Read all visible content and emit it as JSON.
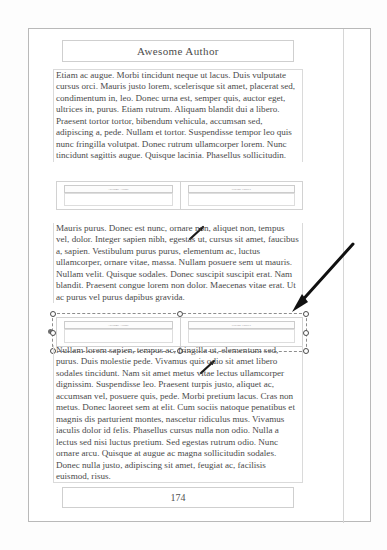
{
  "document": {
    "header": {
      "title": "Awesome Author"
    },
    "footer": {
      "page_number": "174"
    },
    "paragraphs": [
      "Etiam ac augue. Morbi tincidunt neque ut lacus. Duis vulputate cursus orci. Mauris justo lorem, scelerisque sit amet, placerat sed, condimentum in, leo. Donec urna est, semper quis, auctor eget, ultrices in, purus. Etiam rutrum. Aliquam blandit dui a libero. Praesent tortor tortor, bibendum vehicula, accumsan sed, adipiscing a, pede. Nullam et tortor. Suspendisse tempor leo quis nunc fringilla volutpat. Donec rutrum ullamcorper lorem. Nunc tincidunt sagittis augue. Quisque lacinia. Phasellus sollicitudin.",
      "Mauris purus. Donec est nunc, ornare non, aliquet non, tempus vel, dolor. Integer sapien nibh, egestas ut, cursus sit amet, faucibus a, sapien. Vestibulum purus purus, elementum ac, luctus ullamcorper, ornare vitae, massa. Nullam posuere sem ut mauris. Nullam velit. Quisque sodales. Donec suscipit suscipit erat. Nam blandit. Praesent congue lorem non dolor. Maecenas vitae erat. Ut ac purus vel purus dapibus gravida.",
      "Nullam lorem sapien, tempus ac, fringilla ut, elementum sed, purus. Duis molestie pede. Vivamus quis odio sit amet libero sodales tincidunt. Nam sit amet metus vitae lectus ullamcorper dignissim. Suspendisse leo. Praesent turpis justo, aliquet ac, accumsan vel, posuere quis, pede. Morbi pretium lacus. Cras non metus. Donec laoreet sem at elit. Cum sociis natoque penatibus et magnis dis parturient montes, nascetur ridiculus mus. Vivamus iaculis dolor id felis. Phasellus cursus nulla non odio. Nulla a lectus sed nisi luctus pretium. Sed egestas rutrum odio. Nunc ornare arcu. Quisque at augue ac magna sollicitudin sodales. Donec nulla justo, adipiscing sit amet, feugiat ac, facilisis euismod, risus."
    ]
  },
  "figures": [
    {
      "name": "figure-top",
      "selected": false,
      "panes": [
        {
          "label": "Awesome Author"
        },
        {
          "label": "Placing Figures"
        }
      ]
    },
    {
      "name": "figure-bottom",
      "selected": true,
      "panes": [
        {
          "label": "Awesome Author"
        },
        {
          "label": "Placing Figures"
        }
      ]
    }
  ],
  "annotations": {
    "big_arrow": {
      "name": "pointer-arrow",
      "direction": "down-left"
    },
    "mini_arrows": [
      {
        "name": "pen-cursor-top",
        "direction": "up-right"
      },
      {
        "name": "pen-cursor-bottom",
        "direction": "up-right"
      }
    ]
  },
  "colors": {
    "page_background": "#ffffff",
    "canvas_background": "#fdfdfd",
    "text": "#4a4a4a",
    "border": "#d2d2d2",
    "annotation": "#111111",
    "handle_fill": "#ffffff",
    "handle_stroke": "#4b4b4b"
  }
}
